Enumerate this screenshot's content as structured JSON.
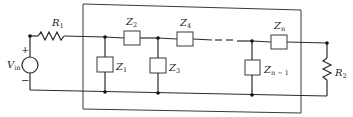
{
  "diagram": {
    "type": "ladder-network-circuit",
    "source": {
      "label": "V",
      "subscript": "in",
      "plus": "+",
      "minus": "−"
    },
    "resistors": [
      {
        "label": "R",
        "subscript": "1"
      },
      {
        "label": "R",
        "subscript": "2"
      }
    ],
    "impedances": [
      {
        "label": "Z",
        "subscript": "1"
      },
      {
        "label": "Z",
        "subscript": "2"
      },
      {
        "label": "Z",
        "subscript": "3"
      },
      {
        "label": "Z",
        "subscript": "4"
      },
      {
        "label": "Z",
        "subscript": "n − 1"
      },
      {
        "label": "Z",
        "subscript": "n"
      }
    ],
    "colors": {
      "line": "#2a2a2a",
      "background": "#ffffff"
    }
  }
}
